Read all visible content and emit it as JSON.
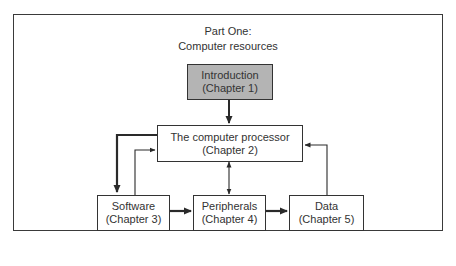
{
  "diagram": {
    "title_line1": "Part One:",
    "title_line2": "Computer resources",
    "nodes": [
      {
        "id": "intro",
        "label": "Introduction",
        "sub": "(Chapter 1)",
        "shaded": true
      },
      {
        "id": "processor",
        "label": "The computer processor",
        "sub": "(Chapter 2)",
        "shaded": false
      },
      {
        "id": "software",
        "label": "Software",
        "sub": "(Chapter 3)",
        "shaded": false
      },
      {
        "id": "peripherals",
        "label": "Peripherals",
        "sub": "(Chapter 4)",
        "shaded": false
      },
      {
        "id": "data",
        "label": "Data",
        "sub": "(Chapter 5)",
        "shaded": false
      }
    ],
    "edges": [
      {
        "from": "intro",
        "to": "processor",
        "style": "thick"
      },
      {
        "from": "processor",
        "to": "software",
        "style": "thick"
      },
      {
        "from": "software",
        "to": "processor",
        "style": "thin"
      },
      {
        "from": "processor",
        "to": "peripherals",
        "style": "thin-bidirectional"
      },
      {
        "from": "software",
        "to": "peripherals",
        "style": "thick"
      },
      {
        "from": "peripherals",
        "to": "data",
        "style": "thick"
      },
      {
        "from": "data",
        "to": "processor",
        "style": "thin"
      }
    ]
  }
}
